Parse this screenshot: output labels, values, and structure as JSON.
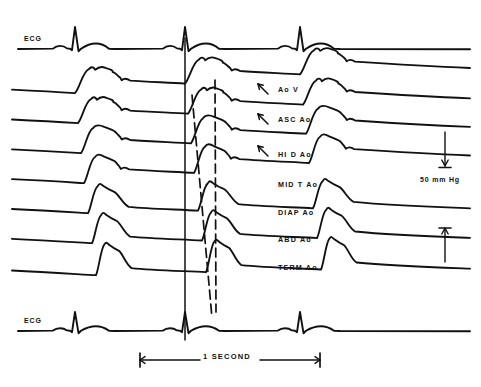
{
  "figure": {
    "background_color": "#ffffff",
    "ink_color": "#111111",
    "width": 481,
    "height": 387
  },
  "chart_data": {
    "type": "line",
    "title": "",
    "subtitle": "",
    "xlabel": "",
    "ylabel": "",
    "grid": false,
    "legend_position": "inline-right",
    "x_axis": {
      "units": "seconds",
      "scale_bar_label": "1 SECOND",
      "scale_bar_span_seconds": 1,
      "scale_bar_x_start_px": 140,
      "scale_bar_x_end_px": 320,
      "scale_bar_y_px": 360
    },
    "y_axis": {
      "units": "mm Hg",
      "calibration_label": "50 mm Hg",
      "calibration_span_mmhg": 50,
      "calibration_x_px": 445,
      "calibration_top_y_px": 132,
      "calibration_bottom_y_px": 228
    },
    "beats": {
      "count_visible": 3,
      "beat_times_px": [
        75,
        185,
        300
      ],
      "cycle_length_px": 112
    },
    "series": [
      {
        "name": "ECG",
        "label": "ECG",
        "kind": "ecg",
        "position": "top",
        "baseline_y_px": 48,
        "label_x_px": 24,
        "label_y_px": 41,
        "r_wave_amplitude_px": 21,
        "p_wave_amplitude_px": 3,
        "t_wave_amplitude_px": 6
      },
      {
        "name": "AoV",
        "label": "Ao V",
        "kind": "pressure",
        "site_order": 1,
        "site_description": "aortic valve",
        "baseline_y_px": 96,
        "label_x_px": 278,
        "label_y_px": 90,
        "foot_delay_px": 0,
        "peak_height_px": 26,
        "peak_width_px": 46,
        "dicrotic_notch": true,
        "notch_arrow": true,
        "arrow_x_px": 258,
        "arrow_y_px": 84,
        "shape": "broad-domed-with-shoulder"
      },
      {
        "name": "ASC_Ao",
        "label": "ASC Ao",
        "kind": "pressure",
        "site_order": 2,
        "site_description": "ascending aorta",
        "baseline_y_px": 126,
        "label_x_px": 278,
        "label_y_px": 120,
        "foot_delay_px": 3,
        "peak_height_px": 26,
        "peak_width_px": 43,
        "dicrotic_notch": true,
        "notch_arrow": true,
        "arrow_x_px": 258,
        "arrow_y_px": 114,
        "shape": "broad-domed-with-shoulder"
      },
      {
        "name": "HI_D_Ao",
        "label": "HI D Ao",
        "kind": "pressure",
        "site_order": 3,
        "site_description": "high descending aorta",
        "baseline_y_px": 156,
        "label_x_px": 278,
        "label_y_px": 155,
        "foot_delay_px": 6,
        "peak_height_px": 27,
        "peak_width_px": 40,
        "dicrotic_notch": true,
        "notch_arrow": true,
        "arrow_x_px": 258,
        "arrow_y_px": 146,
        "shape": "domed"
      },
      {
        "name": "MID_T_Ao",
        "label": "MID T Ao",
        "kind": "pressure",
        "site_order": 4,
        "site_description": "mid thoracic aorta",
        "baseline_y_px": 186,
        "label_x_px": 278,
        "label_y_px": 185,
        "foot_delay_px": 9,
        "peak_height_px": 28,
        "peak_width_px": 36,
        "dicrotic_notch": true,
        "notch_arrow": false,
        "shape": "rounded-peak"
      },
      {
        "name": "DIAP_Ao",
        "label": "DIAP Ao",
        "kind": "pressure",
        "site_order": 5,
        "site_description": "diaphragmatic aorta",
        "baseline_y_px": 216,
        "label_x_px": 278,
        "label_y_px": 213,
        "foot_delay_px": 13,
        "peak_height_px": 29,
        "peak_width_px": 32,
        "dicrotic_notch": false,
        "notch_arrow": false,
        "shape": "peaked"
      },
      {
        "name": "ABD_Ao",
        "label": "ABD Ao",
        "kind": "pressure",
        "site_order": 6,
        "site_description": "abdominal aorta",
        "baseline_y_px": 246,
        "label_x_px": 278,
        "label_y_px": 240,
        "foot_delay_px": 17,
        "peak_height_px": 30,
        "peak_width_px": 30,
        "dicrotic_notch": false,
        "notch_arrow": false,
        "shape": "peaked"
      },
      {
        "name": "TERM_Ao",
        "label": "TERM Ao",
        "kind": "pressure",
        "site_order": 7,
        "site_description": "terminal aorta",
        "baseline_y_px": 278,
        "label_x_px": 278,
        "label_y_px": 268,
        "foot_delay_px": 21,
        "peak_height_px": 32,
        "peak_width_px": 28,
        "dicrotic_notch": false,
        "notch_arrow": false,
        "shape": "sharply-peaked"
      },
      {
        "name": "ECG_bottom",
        "label": "ECG",
        "kind": "ecg",
        "position": "bottom",
        "baseline_y_px": 330,
        "label_x_px": 24,
        "label_y_px": 323,
        "r_wave_amplitude_px": 18,
        "p_wave_amplitude_px": 2.5,
        "t_wave_amplitude_px": 5
      }
    ],
    "annotations": [
      {
        "name": "timing-line",
        "type": "vertical-line",
        "style": "solid",
        "x_px": 185,
        "y_top_px": 38,
        "y_bottom_px": 340
      },
      {
        "name": "foot-propagation-line",
        "type": "sloped-line",
        "style": "dashed",
        "x_top_px": 192,
        "y_top_px": 95,
        "x_bottom_px": 212,
        "y_bottom_px": 318
      },
      {
        "name": "peak-propagation-line",
        "type": "sloped-line",
        "style": "dashed",
        "x_top_px": 215,
        "y_top_px": 80,
        "x_bottom_px": 216,
        "y_bottom_px": 312
      }
    ]
  },
  "labels": {
    "ecg_top": "ECG",
    "ecg_bottom": "ECG",
    "calibration": "50 mm Hg",
    "time_bar": "1 SECOND"
  }
}
